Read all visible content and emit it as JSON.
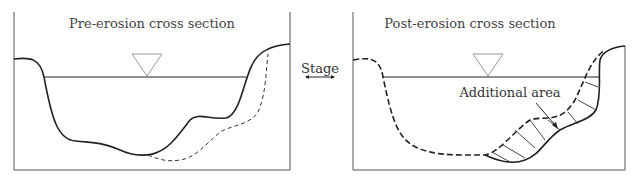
{
  "panels": [
    {
      "title": "Pre-erosion cross section"
    },
    {
      "title": "Post-erosion cross section",
      "annotation": "Additional area"
    }
  ],
  "center_label": "Stage",
  "colors": {
    "line": "#222222",
    "frame": "#555555",
    "triangle": "#999999"
  }
}
